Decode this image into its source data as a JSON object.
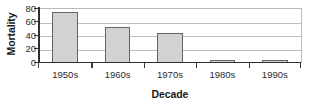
{
  "chart_data": {
    "type": "bar",
    "title": "",
    "subtitle": "",
    "xlabel": "Decade",
    "ylabel": "Mortality",
    "categories": [
      "1950s",
      "1960s",
      "1970s",
      "1980s",
      "1990s"
    ],
    "values": [
      75,
      53,
      44,
      5,
      5
    ],
    "ylim": [
      0,
      80
    ],
    "yticks": [
      0,
      20,
      40,
      60,
      80
    ],
    "ytick_labels": [
      "0",
      "20",
      "40",
      "60",
      "80"
    ],
    "grid": true,
    "grid_axis": "y",
    "legend": false,
    "legend_position": "none",
    "orientation": "vertical",
    "series": [
      {
        "name": "Mortality",
        "values": [
          75,
          53,
          44,
          5,
          5
        ]
      }
    ],
    "annotations": []
  },
  "style": {
    "bar_fill": "#d2d2d2",
    "bar_border": "#646464",
    "gridline_color": "#bcbcbc",
    "axis_color": "#2f2f2f",
    "tick_label_color": "#2b2b2b",
    "axis_title_color": "#1a1a1a",
    "background": "#ffffff"
  }
}
